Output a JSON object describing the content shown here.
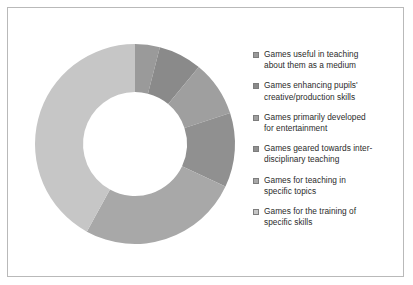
{
  "figure": {
    "border_color": "#b9b9b9",
    "background": "#ffffff"
  },
  "chart_data": {
    "type": "pie",
    "variant": "donut",
    "title": "",
    "xlabel": "",
    "ylabel": "",
    "legend_position": "right",
    "grid": false,
    "start_angle_deg": 0,
    "direction": "clockwise",
    "center": {
      "x": 117,
      "y": 122
    },
    "outer_radius": 100,
    "inner_radius": 52,
    "categories": [
      "Games useful in teaching about them as a medium",
      "Games enhancing  pupils' creative/production skills",
      "Games primarily developed for entertainment",
      "Games geared towards inter-disciplinary teaching",
      "Games for teaching in specific topics",
      "Games for the training of specific skills"
    ],
    "values": [
      4,
      7,
      9,
      12,
      26,
      42
    ],
    "colors": [
      "#9a9a9a",
      "#8a8a8a",
      "#9f9f9f",
      "#909090",
      "#a8a8a8",
      "#c6c6c6"
    ]
  },
  "legend": {
    "items": [
      {
        "label": "Games useful in teaching about them as a medium",
        "line1": "Games useful in teaching",
        "line2": "about them as a medium",
        "color": "#9a9a9a"
      },
      {
        "label": "Games enhancing  pupils' creative/production skills",
        "line1": "Games enhancing  pupils'",
        "line2": "creative/production skills",
        "color": "#8a8a8a"
      },
      {
        "label": "Games primarily developed for entertainment",
        "line1": "Games primarily developed",
        "line2": "for entertainment",
        "color": "#9f9f9f"
      },
      {
        "label": "Games geared towards inter-disciplinary teaching",
        "line1": "Games geared towards inter-",
        "line2": "disciplinary teaching",
        "color": "#909090"
      },
      {
        "label": "Games for teaching in specific topics",
        "line1": "Games for teaching in",
        "line2": "specific topics",
        "color": "#a8a8a8"
      },
      {
        "label": "Games for the training of specific skills",
        "line1": "Games for the training of",
        "line2": "specific skills",
        "color": "#c6c6c6"
      }
    ]
  }
}
